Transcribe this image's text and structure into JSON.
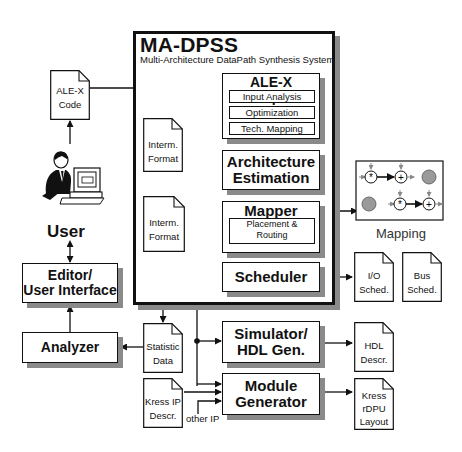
{
  "system": {
    "title": "MA-DPSS",
    "subtitle": "Multi-Architecture DataPath Synthesis System"
  },
  "blocks": {
    "compiler": {
      "title": "ALE-X Compiler",
      "steps": [
        "Input Analysis",
        "Optimization",
        "Tech. Mapping"
      ]
    },
    "arch_est": {
      "line1": "Architecture",
      "line2": "Estimation"
    },
    "mapper": {
      "title": "Mapper",
      "sub_line1": "Placement &",
      "sub_line2": "Routing"
    },
    "scheduler": {
      "title": "Scheduler"
    },
    "simulator": {
      "line1": "Simulator/",
      "line2": "HDL Gen."
    },
    "module_gen": {
      "line1": "Module",
      "line2": "Generator"
    },
    "editor": {
      "line1": "Editor/",
      "line2": "User Interface"
    },
    "analyzer": {
      "title": "Analyzer"
    }
  },
  "documents": {
    "alex_code": {
      "line1": "ALE-X",
      "line2": "Code"
    },
    "interm1": {
      "line1": "Interm.",
      "line2": "Format"
    },
    "interm2": {
      "line1": "Interm.",
      "line2": "Format"
    },
    "statistic": {
      "line1": "Statistic",
      "line2": "Data"
    },
    "kress_ip": {
      "line1": "Kress IP",
      "line2": "Descr."
    },
    "io_sched": {
      "line1": "I/O",
      "line2": "Sched."
    },
    "bus_sched": {
      "line1": "Bus",
      "line2": "Sched."
    },
    "hdl_descr": {
      "line1": "HDL",
      "line2": "Descr."
    },
    "kress_rdpu": {
      "line1": "Kress",
      "line2": "rDPU",
      "line3": "Layout"
    }
  },
  "labels": {
    "user": "User",
    "other_ip": "other IP",
    "mapping": "Mapping"
  },
  "mapping_ops": {
    "row1": [
      "*",
      "+"
    ],
    "row2": [
      "*",
      "+"
    ]
  },
  "colors": {
    "line": "#111111",
    "shadow": "#8a8a8a",
    "node_fill": "#9a9a9a",
    "arrow_gray": "#888888"
  }
}
